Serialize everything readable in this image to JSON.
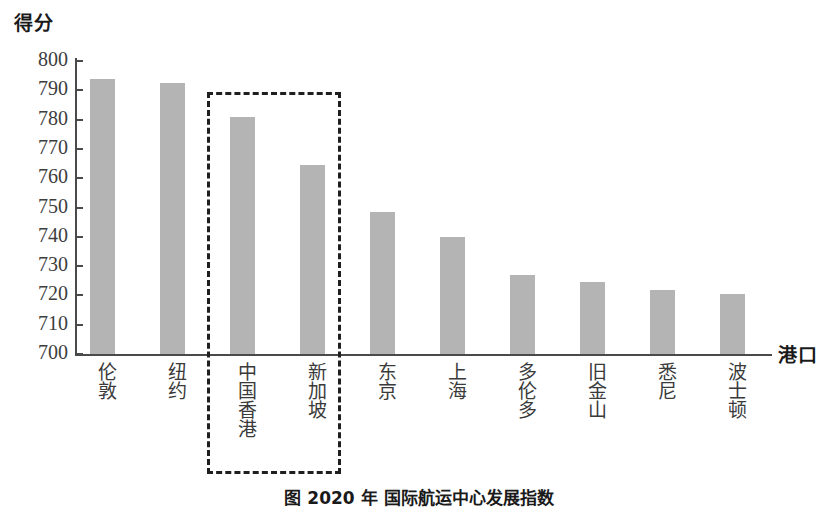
{
  "chart_data": {
    "type": "bar",
    "title": "",
    "ylabel": "得分",
    "xlabel": "港口",
    "ylim": [
      700,
      800
    ],
    "ytick_step": 10,
    "ytick_labels": [
      "800",
      "790",
      "780",
      "770",
      "760",
      "750",
      "740",
      "730",
      "720",
      "710",
      "700"
    ],
    "grid": false,
    "legend": "none",
    "bar_color": "#b4b4b4",
    "categories": [
      "伦敦",
      "纽约",
      "中国香港",
      "新加坡",
      "东京",
      "上海",
      "多伦多",
      "旧金山",
      "悉尼",
      "波士顿"
    ],
    "values": [
      794,
      792.5,
      781,
      764.5,
      748.5,
      740,
      727,
      724.5,
      722,
      720.5
    ],
    "annotations": [
      {
        "name": "highlight-box",
        "style": "dashed-rectangle",
        "color": "#1f1f1f",
        "covers": [
          "中国香港",
          "新加坡"
        ]
      }
    ]
  },
  "caption": {
    "text": "图   2020 年     国际航运中心发展指数"
  }
}
